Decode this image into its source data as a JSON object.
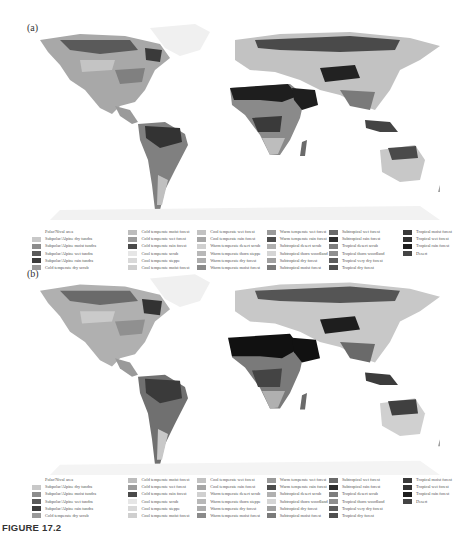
{
  "panels": [
    {
      "label": "(a)"
    },
    {
      "label": "(b)"
    }
  ],
  "legend": {
    "columns": [
      [
        {
          "label": "Polar/Nival area",
          "color": "#ffffff"
        },
        {
          "label": "Subpolar/Alpine dry tundra",
          "color": "#c8c8c8"
        },
        {
          "label": "Subpolar/Alpine moist tundra",
          "color": "#8c8c8c"
        },
        {
          "label": "Subpolar/Alpine wet tundra",
          "color": "#5a5a5a"
        },
        {
          "label": "Subpolar/Alpine rain tundra",
          "color": "#3c3c3c"
        },
        {
          "label": "Cold temperate dry scrub",
          "color": "#9a9a9a"
        }
      ],
      [
        {
          "label": "Cold temperate moist forest",
          "color": "#bdbdbd"
        },
        {
          "label": "Cold temperate wet forest",
          "color": "#9c9c9c"
        },
        {
          "label": "Cold temperate rain forest",
          "color": "#4a4a4a"
        },
        {
          "label": "Cool temperate scrub",
          "color": "#e6e6e6"
        },
        {
          "label": "Cool temperate steppe",
          "color": "#d9d9d9"
        },
        {
          "label": "Cool temperate moist forest",
          "color": "#cfcfcf"
        }
      ],
      [
        {
          "label": "Cool temperate wet forest",
          "color": "#c2c2c2"
        },
        {
          "label": "Cool temperate rain forest",
          "color": "#a6a6a6"
        },
        {
          "label": "Warm temperate desert scrub",
          "color": "#d0d0d0"
        },
        {
          "label": "Warm temperate thorn steppe",
          "color": "#b8b8b8"
        },
        {
          "label": "Warm temperate dry forest",
          "color": "#adadad"
        },
        {
          "label": "Warm temperate moist forest",
          "color": "#8a8a8a"
        }
      ],
      [
        {
          "label": "Warm temperate wet forest",
          "color": "#9a9a9a"
        },
        {
          "label": "Warm temperate rain forest",
          "color": "#4d4d4d"
        },
        {
          "label": "Subtropical desert scrub",
          "color": "#b0b0b0"
        },
        {
          "label": "Subtropical thorn woodland",
          "color": "#d5d5d5"
        },
        {
          "label": "Subtropical dry forest",
          "color": "#a0a0a0"
        },
        {
          "label": "Subtropical moist forest",
          "color": "#7a7a7a"
        }
      ],
      [
        {
          "label": "Subtropical wet forest",
          "color": "#6a6a6a"
        },
        {
          "label": "Subtropical rain forest",
          "color": "#2e2e2e"
        },
        {
          "label": "Tropical desert scrub",
          "color": "#7e7e7e"
        },
        {
          "label": "Tropical thorn woodland",
          "color": "#8f8f8f"
        },
        {
          "label": "Tropical very dry forest",
          "color": "#5e5e5e"
        },
        {
          "label": "Tropical dry forest",
          "color": "#505050"
        }
      ],
      [
        {
          "label": "Tropical moist forest",
          "color": "#3a3a3a"
        },
        {
          "label": "Tropical wet forest",
          "color": "#333333"
        },
        {
          "label": "Tropical rain forest",
          "color": "#1e1e1e"
        },
        {
          "label": "Desert",
          "color": "#444444"
        }
      ]
    ]
  },
  "caption": "FIGURE 17.2"
}
